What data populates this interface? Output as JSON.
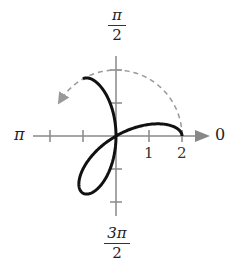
{
  "chart_data": {
    "type": "polar",
    "title": "",
    "equation_hint": "r = 2cos(3θ) traced from θ = 0",
    "origin_px": [
      116,
      136
    ],
    "unit_px": 33,
    "angle_labels": {
      "right": "0",
      "top_num": "π",
      "top_den": "2",
      "left": "π",
      "bottom_num": "3π",
      "bottom_den": "2"
    },
    "radial_ticks": [
      1,
      2
    ],
    "radial_tick_labels": [
      "1",
      "2"
    ],
    "curve": {
      "function": "2*cos(3*t)",
      "theta_start": 0,
      "theta_end": 3.14159,
      "stroke": "#111111",
      "width": 3
    },
    "dashed_arc": {
      "radius": 2,
      "theta_start": 0,
      "theta_end": 2.6,
      "stroke": "#999999"
    },
    "axis_color": "#888888"
  }
}
